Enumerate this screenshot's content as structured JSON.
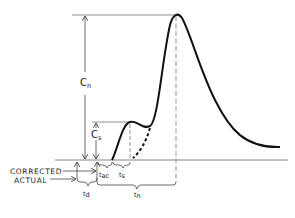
{
  "diagram": {
    "labels": {
      "cn": {
        "main": "C",
        "sub": "n"
      },
      "cs": {
        "main": "C",
        "sub": "s"
      },
      "corrected": "CORRECTED",
      "actual": "ACTUAL",
      "tac": {
        "main": "t",
        "sub": "ac"
      },
      "ts": {
        "main": "t",
        "sub": "s"
      },
      "td": {
        "main": "t",
        "sub": "d"
      },
      "tn": {
        "main": "t",
        "sub": "n"
      }
    },
    "colors": {
      "curve": "#111111",
      "guide": "#555555",
      "background": "#ffffff"
    }
  }
}
